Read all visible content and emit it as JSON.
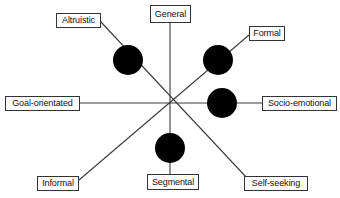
{
  "diagram": {
    "type": "radial-axis-diagram",
    "title": "",
    "canvas": {
      "width": 340,
      "height": 198,
      "background": "#ffffff"
    },
    "center": {
      "x": 170,
      "y": 103
    },
    "colors": {
      "line": "#3a3a3a",
      "dot": "#000000",
      "label_border": "#333333",
      "label_background": "#ffffff",
      "label_text": "#111111"
    },
    "axes": [
      {
        "name": "vertical-axis",
        "pole_a": "General",
        "pole_b": "Segmental",
        "x1": 170,
        "y1": 23,
        "x2": 170,
        "y2": 174
      },
      {
        "name": "horizontal-axis",
        "pole_a": "Goal-orientated",
        "pole_b": "Socio-emotional",
        "x1": 79,
        "y1": 103,
        "x2": 262,
        "y2": 103
      },
      {
        "name": "altruistic-self-seeking-axis",
        "pole_a": "Altruistic",
        "pole_b": "Self-seeking",
        "x1": 100,
        "y1": 21,
        "x2": 247,
        "y2": 178
      },
      {
        "name": "formal-informal-axis",
        "pole_a": "Formal",
        "pole_b": "Informal",
        "x1": 249,
        "y1": 35,
        "x2": 79,
        "y2": 180
      }
    ],
    "labels": [
      {
        "id": "general",
        "text": "General",
        "x": 150,
        "y": 5,
        "w": 41,
        "h": 18
      },
      {
        "id": "altruistic",
        "text": "Altruistic",
        "x": 56,
        "y": 13,
        "w": 45,
        "h": 15
      },
      {
        "id": "formal",
        "text": "Formal",
        "x": 249,
        "y": 26,
        "w": 36,
        "h": 15
      },
      {
        "id": "goal-orientated",
        "text": "Goal-orientated",
        "x": 5,
        "y": 96,
        "w": 75,
        "h": 15
      },
      {
        "id": "socio-emotional",
        "text": "Socio-emotional",
        "x": 262,
        "y": 96,
        "w": 75,
        "h": 15
      },
      {
        "id": "informal",
        "text": "Informal",
        "x": 37,
        "y": 176,
        "w": 42,
        "h": 15
      },
      {
        "id": "segmental",
        "text": "Segmental",
        "x": 147,
        "y": 174,
        "w": 52,
        "h": 16
      },
      {
        "id": "self-seeking",
        "text": "Self-seeking",
        "x": 244,
        "y": 176,
        "w": 64,
        "h": 15
      }
    ],
    "nodes": [
      {
        "id": "altruistic-node",
        "cx": 128,
        "cy": 60,
        "r": 15,
        "on_axis": "altruistic-self-seeking-axis"
      },
      {
        "id": "formal-node",
        "cx": 218,
        "cy": 60,
        "r": 15,
        "on_axis": "formal-informal-axis"
      },
      {
        "id": "socio-emotional-node",
        "cx": 222,
        "cy": 103,
        "r": 15,
        "on_axis": "horizontal-axis"
      },
      {
        "id": "segmental-node",
        "cx": 170,
        "cy": 148,
        "r": 15,
        "on_axis": "vertical-axis"
      }
    ]
  }
}
